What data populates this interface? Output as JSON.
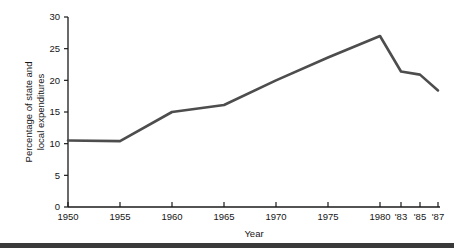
{
  "chart_data": {
    "type": "line",
    "title": "",
    "xlabel": "Year",
    "ylabel": "Percentage of state and local expenditures",
    "ylabel_line1": "Percentage of state and",
    "ylabel_line2": "local expenditures",
    "x": [
      1950,
      1955,
      1960,
      1965,
      1970,
      1975,
      1980,
      1983,
      1985,
      1987
    ],
    "xtick_labels": [
      "1950",
      "1955",
      "1960",
      "1965",
      "1970",
      "1975",
      "1980",
      "'83",
      "'85",
      "'87"
    ],
    "values": [
      10.5,
      10.4,
      15.0,
      16.1,
      20.0,
      23.6,
      27.0,
      21.4,
      20.9,
      18.4
    ],
    "ytick_labels": [
      "0",
      "5",
      "10",
      "15",
      "20",
      "25",
      "30"
    ],
    "ytick_values": [
      0,
      5,
      10,
      15,
      20,
      25,
      30
    ],
    "ylim": [
      0,
      30
    ],
    "grid": false,
    "legend": false,
    "legend_position": "none",
    "series_color": "#4d4d4d",
    "axis_color": "#1a1a1a"
  },
  "footer": {
    "rule_color": "#3a3a3a"
  }
}
